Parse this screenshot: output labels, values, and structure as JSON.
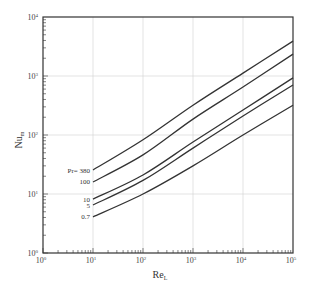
{
  "chart_data": {
    "type": "line",
    "title": "",
    "xlabel": "Re_L",
    "ylabel": "Nu_m",
    "xscale": "log",
    "yscale": "log",
    "xlim": [
      1,
      100000
    ],
    "ylim": [
      1,
      10000
    ],
    "grid": true,
    "legend_position": "inline labels at left end of curves",
    "x_ticks": [
      "10^0",
      "10^1",
      "10^2",
      "10^3",
      "10^4",
      "10^5"
    ],
    "y_ticks": [
      "10^0",
      "10^1",
      "10^2",
      "10^3",
      "10^4"
    ],
    "x": [
      10,
      100,
      1000,
      10000,
      100000
    ],
    "series": [
      {
        "name": "Pr = 380",
        "label": "Pr= 380",
        "values": [
          25.5,
          83,
          320,
          1120,
          3900
        ]
      },
      {
        "name": "Pr = 100",
        "label": "100",
        "values": [
          16,
          46,
          186,
          650,
          2350
        ]
      },
      {
        "name": "Pr = 10",
        "label": "10",
        "values": [
          8.2,
          21,
          76,
          265,
          930
        ]
      },
      {
        "name": "Pr = 5",
        "label": "5",
        "values": [
          6.5,
          17,
          60,
          210,
          705
        ]
      },
      {
        "name": "Pr = 0.7",
        "label": "0.7",
        "values": [
          4.1,
          10,
          30,
          100,
          320
        ]
      }
    ]
  },
  "axes": {
    "x_base": "10",
    "y_base": "10",
    "x_exponents": [
      "0",
      "1",
      "2",
      "3",
      "4",
      "5"
    ],
    "y_exponents": [
      "0",
      "1",
      "2",
      "3",
      "4"
    ],
    "xlabel_main": "Re",
    "xlabel_sub": "L",
    "ylabel_main": "Nu",
    "ylabel_sub": "m"
  },
  "colors": {
    "line": "#333333",
    "frame": "#333333",
    "grid": "#d0d0d0"
  }
}
